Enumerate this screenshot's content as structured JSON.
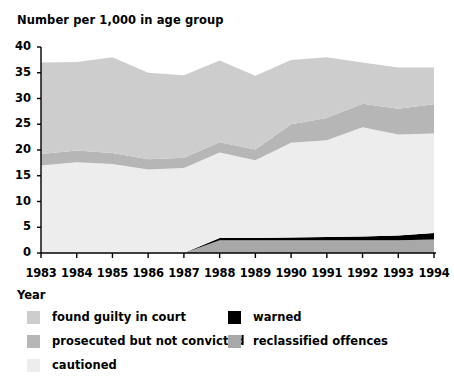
{
  "chart_data": {
    "type": "area",
    "stacked": true,
    "title": "Number per 1,000 in age group",
    "xlabel": "Year",
    "ylabel": "",
    "grid": false,
    "legend_position": "bottom",
    "x": [
      1983,
      1984,
      1985,
      1986,
      1987,
      1988,
      1989,
      1990,
      1991,
      1992,
      1993,
      1994
    ],
    "categories": [
      "1983",
      "1984",
      "1985",
      "1986",
      "1987",
      "1988",
      "1989",
      "1990",
      "1991",
      "1992",
      "1993",
      "1994"
    ],
    "xlim": [
      1983,
      1994
    ],
    "ylim": [
      0,
      40
    ],
    "yticks": [
      0,
      5,
      10,
      15,
      20,
      25,
      30,
      35,
      40
    ],
    "xticks": [
      "1983",
      "1984",
      "1985",
      "1986",
      "1987",
      "1988",
      "1989",
      "1990",
      "1991",
      "1992",
      "1993",
      "1994"
    ],
    "series": [
      {
        "name": "reclassified offences",
        "color": "#a8a8a8",
        "values": [
          0,
          0,
          0,
          0,
          0,
          2.5,
          2.5,
          2.5,
          2.5,
          2.5,
          2.5,
          2.6
        ]
      },
      {
        "name": "warned",
        "color": "#000000",
        "values": [
          0,
          0,
          0,
          0,
          0,
          0.4,
          0.4,
          0.5,
          0.6,
          0.7,
          0.9,
          1.3
        ]
      },
      {
        "name": "cautioned",
        "color": "#ededed",
        "values": [
          17.0,
          17.6,
          17.3,
          16.2,
          16.5,
          16.6,
          15.1,
          18.4,
          18.8,
          21.2,
          19.6,
          19.3
        ]
      },
      {
        "name": "prosecuted but not convicted",
        "color": "#b6b6b6",
        "values": [
          2.2,
          2.3,
          2.1,
          2.0,
          2.0,
          2.0,
          2.1,
          3.6,
          4.3,
          4.6,
          5.0,
          5.7
        ]
      },
      {
        "name": "found guilty in court",
        "color": "#cdcdcd",
        "values": [
          17.8,
          17.2,
          18.6,
          16.8,
          16.0,
          15.9,
          14.3,
          12.5,
          11.8,
          8.0,
          8.0,
          7.1
        ]
      }
    ],
    "stack_tops": {
      "reclassified": [
        0,
        0,
        0,
        0,
        0,
        2.5,
        2.5,
        2.5,
        2.5,
        2.5,
        2.5,
        2.6
      ],
      "warned": [
        0,
        0,
        0,
        0,
        0,
        2.9,
        2.9,
        3.0,
        3.1,
        3.2,
        3.4,
        3.9
      ],
      "cautioned": [
        17.0,
        17.6,
        17.3,
        16.2,
        16.5,
        19.5,
        18.0,
        21.4,
        21.9,
        24.4,
        23.0,
        23.2
      ],
      "prosecuted": [
        19.2,
        19.9,
        19.4,
        18.2,
        18.5,
        21.5,
        20.1,
        25.0,
        26.2,
        29.0,
        28.0,
        28.9
      ],
      "found_guilty": [
        37.0,
        37.1,
        38.0,
        35.0,
        34.5,
        37.4,
        34.4,
        37.5,
        38.0,
        37.0,
        36.0,
        36.0
      ]
    }
  },
  "legend": {
    "items": [
      {
        "label": "found guilty in court",
        "color": "#cdcdcd",
        "column": "left",
        "row": 0
      },
      {
        "label": "prosecuted but not convicted",
        "color": "#b6b6b6",
        "column": "left",
        "row": 1
      },
      {
        "label": "cautioned",
        "color": "#ededed",
        "column": "left",
        "row": 2
      },
      {
        "label": "warned",
        "color": "#000000",
        "column": "right",
        "row": 0
      },
      {
        "label": "reclassified offences",
        "color": "#a8a8a8",
        "column": "right",
        "row": 1
      }
    ]
  }
}
